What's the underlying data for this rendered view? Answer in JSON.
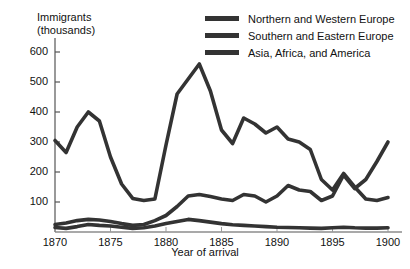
{
  "chart_data": {
    "type": "line",
    "title": "",
    "ylabel": "Immigrants\n(thousands)",
    "ylabel_line1": "Immigrants",
    "ylabel_line2": "(thousands)",
    "xlabel": "Year of arrival",
    "xlim": [
      1870,
      1900
    ],
    "ylim": [
      0,
      640
    ],
    "yticks": [
      100,
      200,
      300,
      400,
      500,
      600
    ],
    "ytick_labels": [
      "100",
      "200",
      "300",
      "400",
      "500",
      "600"
    ],
    "xticks": [
      1870,
      1875,
      1880,
      1885,
      1890,
      1895,
      1900
    ],
    "xtick_labels": [
      "1870",
      "1875",
      "1880",
      "1885",
      "1890",
      "1895",
      "1900"
    ],
    "grid": false,
    "legend_position": "top-right",
    "line_color": "#333333",
    "x": [
      1870,
      1871,
      1872,
      1873,
      1874,
      1875,
      1876,
      1877,
      1878,
      1879,
      1880,
      1881,
      1882,
      1883,
      1884,
      1885,
      1886,
      1887,
      1888,
      1889,
      1890,
      1891,
      1892,
      1893,
      1894,
      1895,
      1896,
      1897,
      1898,
      1899,
      1900
    ],
    "series": [
      {
        "name": "Northern and Western Europe",
        "values": [
          305,
          265,
          350,
          400,
          370,
          250,
          160,
          112,
          105,
          110,
          290,
          460,
          510,
          560,
          470,
          340,
          295,
          380,
          360,
          330,
          350,
          310,
          300,
          275,
          175,
          140,
          195,
          150,
          110,
          105,
          115
        ]
      },
      {
        "name": "Southern and Eastern Europe",
        "values": [
          25,
          30,
          38,
          42,
          40,
          35,
          28,
          22,
          25,
          38,
          55,
          85,
          120,
          125,
          118,
          110,
          105,
          125,
          120,
          100,
          120,
          155,
          140,
          135,
          105,
          120,
          190,
          145,
          175,
          235,
          300
        ]
      },
      {
        "name": "Asia, Africa, and America",
        "values": [
          15,
          12,
          18,
          25,
          22,
          20,
          16,
          12,
          14,
          20,
          28,
          35,
          42,
          38,
          33,
          28,
          24,
          22,
          20,
          18,
          16,
          15,
          14,
          13,
          12,
          14,
          16,
          14,
          13,
          13,
          14
        ]
      }
    ]
  },
  "legend": {
    "items": [
      {
        "label": "Northern and Western Europe"
      },
      {
        "label": "Southern and Eastern Europe"
      },
      {
        "label": "Asia, Africa, and America"
      }
    ]
  }
}
